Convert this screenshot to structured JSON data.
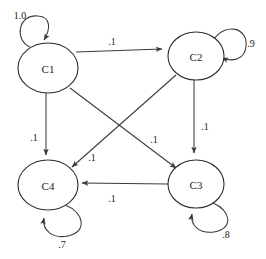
{
  "diagram": {
    "type": "state-transition-graph",
    "title": "",
    "canvas": {
      "width": 266,
      "height": 259,
      "background": "#ffffff"
    },
    "style": {
      "stroke_color": "#3a3a3a",
      "node_stroke_color": "#2b2b2b",
      "node_fill": "#ffffff",
      "text_color": "#1a1a1a"
    },
    "nodes": [
      {
        "id": "C1",
        "label": "C1",
        "cx": 48,
        "cy": 68,
        "rx": 30,
        "ry": 25
      },
      {
        "id": "C2",
        "label": "C2",
        "cx": 196,
        "cy": 56,
        "rx": 28,
        "ry": 24
      },
      {
        "id": "C4",
        "label": "C4",
        "cx": 48,
        "cy": 185,
        "rx": 30,
        "ry": 25
      },
      {
        "id": "C3",
        "label": "C3",
        "cx": 196,
        "cy": 184,
        "rx": 28,
        "ry": 24
      }
    ],
    "edges": [
      {
        "from": "C1",
        "to": "C2",
        "weight": ".1",
        "label_x": 112,
        "label_y": 42
      },
      {
        "from": "C1",
        "to": "C4",
        "weight": ".1",
        "label_x": 35,
        "label_y": 137
      },
      {
        "from": "C1",
        "to": "C3",
        "weight": ".1",
        "label_x": 153,
        "label_y": 139
      },
      {
        "from": "C2",
        "to": "C4",
        "weight": ".1",
        "label_x": 92,
        "label_y": 157
      },
      {
        "from": "C2",
        "to": "C3",
        "weight": ".1",
        "label_x": 204,
        "label_y": 126
      },
      {
        "from": "C3",
        "to": "C4",
        "weight": ".1",
        "label_x": 112,
        "label_y": 197
      }
    ],
    "self_loops": [
      {
        "node": "C1",
        "weight": "1.0",
        "position": "top-left",
        "label_x": 20,
        "label_y": 15
      },
      {
        "node": "C2",
        "weight": ".9",
        "position": "right",
        "label_x": 250,
        "label_y": 43
      },
      {
        "node": "C4",
        "weight": ".7",
        "position": "bottom-right",
        "label_x": 62,
        "label_y": 243
      },
      {
        "node": "C3",
        "weight": ".8",
        "position": "bottom-right",
        "label_x": 225,
        "label_y": 233
      }
    ]
  }
}
